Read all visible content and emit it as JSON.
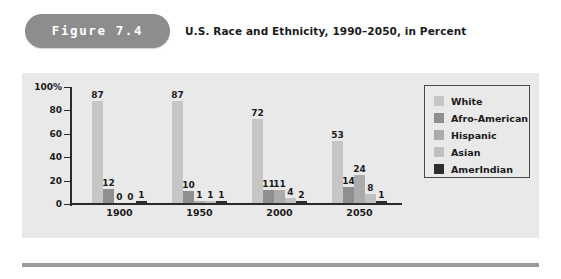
{
  "header": {
    "figure_label": "Figure 7.4",
    "title": "U.S. Race and Ethnicity, 1990–2050, in Percent",
    "pill_color": "#8d8d8d"
  },
  "panel": {
    "background": "#e9e9e9"
  },
  "legend": {
    "position": "top-right",
    "items": [
      {
        "label": "White",
        "color": "#c6c6c6"
      },
      {
        "label": "Afro-American",
        "color": "#8f8f8f"
      },
      {
        "label": "Hispanic",
        "color": "#ababab"
      },
      {
        "label": "Asian",
        "color": "#c0c0c0"
      },
      {
        "label": "AmerIndian",
        "color": "#2e2e2e"
      }
    ]
  },
  "chart_data": {
    "type": "bar",
    "title": "U.S. Race and Ethnicity, 1990–2050, in Percent",
    "xlabel": "",
    "ylabel": "",
    "categories": [
      "1900",
      "1950",
      "2000",
      "2050"
    ],
    "ylim": [
      0,
      100
    ],
    "yticks": [
      "0",
      "20",
      "40",
      "60",
      "80",
      "100%"
    ],
    "ytick_values": [
      0,
      20,
      40,
      60,
      80,
      100
    ],
    "grid": false,
    "legend_position": "top-right",
    "series": [
      {
        "name": "White",
        "color": "#c6c6c6",
        "values": [
          87,
          87,
          72,
          53
        ]
      },
      {
        "name": "Afro-American",
        "color": "#8f8f8f",
        "values": [
          12,
          10,
          11,
          14
        ]
      },
      {
        "name": "Hispanic",
        "color": "#ababab",
        "values": [
          0,
          1,
          11,
          24
        ]
      },
      {
        "name": "Asian",
        "color": "#c0c0c0",
        "values": [
          0,
          1,
          4,
          8
        ]
      },
      {
        "name": "AmerIndian",
        "color": "#2e2e2e",
        "values": [
          1,
          1,
          2,
          1
        ]
      }
    ]
  }
}
